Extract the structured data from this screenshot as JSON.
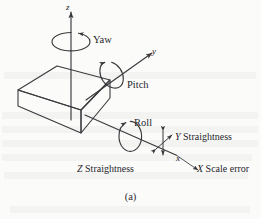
{
  "figure": {
    "caption": "(a)",
    "axes": [
      {
        "id": "z",
        "label": "z"
      },
      {
        "id": "y",
        "label": "y"
      },
      {
        "id": "x",
        "label": "x"
      }
    ],
    "rotation_labels": [
      {
        "id": "yaw",
        "label": "Yaw",
        "axis": "z"
      },
      {
        "id": "pitch",
        "label": "Pitch",
        "axis": "y"
      },
      {
        "id": "roll",
        "label": "Roll",
        "axis": "x"
      }
    ],
    "error_labels": [
      {
        "id": "y-straightness",
        "label": "Y Straightness",
        "prefix": "Y",
        "rest": " Straightness"
      },
      {
        "id": "z-straightness",
        "label": "Z Straightness",
        "prefix": "Z",
        "rest": " Straightness"
      },
      {
        "id": "x-scale-error",
        "label": "X Scale error",
        "prefix": "X",
        "rest": " Scale error"
      }
    ],
    "colors": {
      "line": "#3a3a3e",
      "text": "#26262a",
      "background": "#fbfbfa"
    }
  }
}
